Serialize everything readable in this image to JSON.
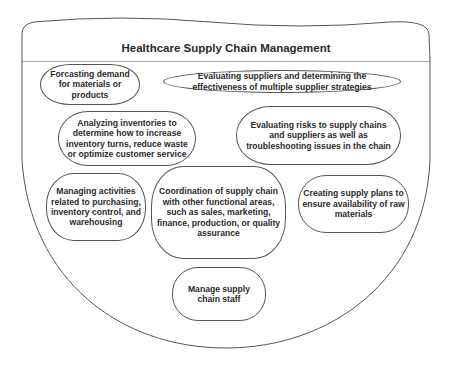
{
  "diagram": {
    "title": "Healthcare Supply Chain Management",
    "nodes": [
      {
        "id": "forecasting",
        "label": "Forcasting demand\nfor materials or\nproducts"
      },
      {
        "id": "evaluating-suppliers",
        "label": "Evaluating suppliers and determining the\neffectiveness of multiple supplier strategies"
      },
      {
        "id": "analyzing-inventories",
        "label": "Analyzing inventories to\ndetermine how to increase\ninventory turns, reduce waste\nor optimize customer service"
      },
      {
        "id": "evaluating-risks",
        "label": "Evaluating risks to supply chains\nand suppliers as well as\ntroubleshooting issues in the chain"
      },
      {
        "id": "managing-activities",
        "label": "Managing activities\nrelated to purchasing,\ninventory control, and\nwarehousing"
      },
      {
        "id": "coordination",
        "label": "Coordination of supply chain\nwith other functional areas,\nsuch as sales, marketing,\nfinance, production, or quality\nassurance"
      },
      {
        "id": "creating-plans",
        "label": "Creating supply plans to\nensure availability of raw\nmaterials"
      },
      {
        "id": "manage-staff",
        "label": "Manage supply\nchain staff"
      }
    ],
    "colors": {
      "stroke": "#555555",
      "text": "#2b2b2b",
      "background": "#ffffff"
    }
  }
}
